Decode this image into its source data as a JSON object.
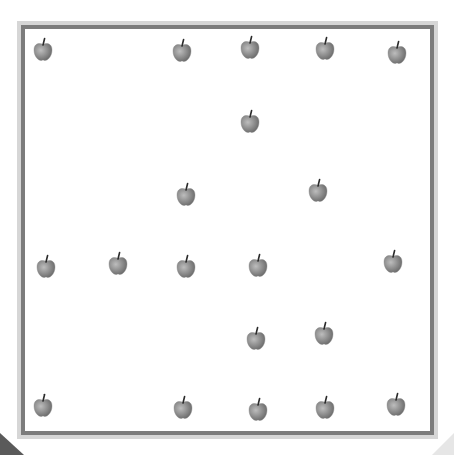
{
  "scene": {
    "description": "Counting grid of apples inside a double-bordered square frame",
    "apple_count": 21,
    "colors": {
      "background": "#ffffff",
      "frame_outer": "#d6d6d6",
      "frame_inner": "#7c7c7c",
      "apple_body": "#8c8c8c",
      "apple_highlight": "#b8b8b8",
      "apple_shadow": "#6e6e6e",
      "apple_stem": "#2a2a2a",
      "corner_dark": "#5a5a5a",
      "corner_light": "#e6e6e6"
    },
    "icon": "apple-icon",
    "apples": [
      {
        "x": 43,
        "y": 50
      },
      {
        "x": 182,
        "y": 51
      },
      {
        "x": 250,
        "y": 48
      },
      {
        "x": 325,
        "y": 49
      },
      {
        "x": 397,
        "y": 53
      },
      {
        "x": 250,
        "y": 122
      },
      {
        "x": 186,
        "y": 195
      },
      {
        "x": 318,
        "y": 191
      },
      {
        "x": 46,
        "y": 267
      },
      {
        "x": 118,
        "y": 264
      },
      {
        "x": 186,
        "y": 267
      },
      {
        "x": 258,
        "y": 266
      },
      {
        "x": 393,
        "y": 262
      },
      {
        "x": 256,
        "y": 339
      },
      {
        "x": 324,
        "y": 334
      },
      {
        "x": 43,
        "y": 406
      },
      {
        "x": 183,
        "y": 408
      },
      {
        "x": 258,
        "y": 410
      },
      {
        "x": 325,
        "y": 408
      },
      {
        "x": 396,
        "y": 405
      }
    ]
  }
}
